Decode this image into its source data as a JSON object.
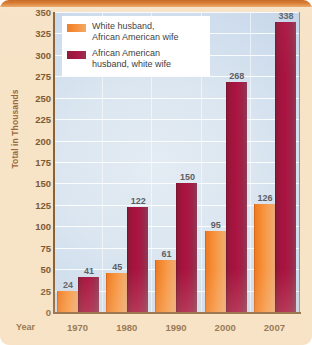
{
  "chart_data": {
    "type": "bar",
    "title": "",
    "subtitle": "",
    "xlabel": "Year",
    "ylabel": "Total in Thousands",
    "categories": [
      "1970",
      "1980",
      "1990",
      "2000",
      "2007"
    ],
    "series": [
      {
        "name": "White husband, African American wife",
        "color": "#f1852c",
        "values": [
          24,
          45,
          61,
          95,
          126
        ]
      },
      {
        "name": "African American husband, white wife",
        "color": "#a3143d",
        "values": [
          41,
          122,
          150,
          268,
          338
        ]
      }
    ],
    "ylim": [
      0,
      350
    ],
    "ytick_step": 25,
    "yticks": [
      "350",
      "325",
      "300",
      "275",
      "250",
      "225",
      "200",
      "175",
      "150",
      "125",
      "100",
      "75",
      "50",
      "25",
      "0"
    ],
    "grid": "horizontal-white",
    "legend_position": "top-left",
    "data_labels": true,
    "annotations": []
  },
  "legend": {
    "entries": [
      {
        "label_line1": "White husband,",
        "label_line2": "African American wife",
        "swatch": "orange-swatch"
      },
      {
        "label_line1": "African American",
        "label_line2": "husband, white wife",
        "swatch": "maroon-swatch"
      }
    ]
  },
  "colors": {
    "page_background": "#f7e3c6",
    "top_band": "#c4631e",
    "plot_background": "#d5e1ee",
    "axis": "#8a6238",
    "tick_text": "#7d5a33",
    "data_label_text": "#5d5f66",
    "orange_bar": "#f1852c",
    "maroon_bar": "#a3143d",
    "gridline": "#ffffff"
  }
}
